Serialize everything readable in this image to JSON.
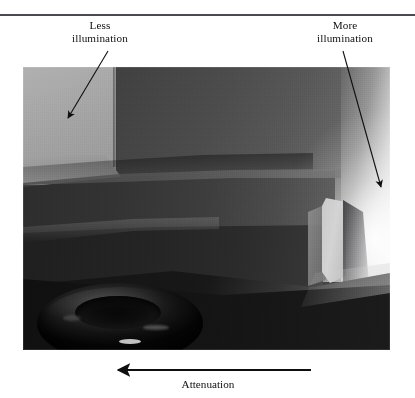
{
  "figure": {
    "kind": "annotated-rendered-image",
    "rule_color": "#4a4a52",
    "background": "#ffffff"
  },
  "annotations": {
    "less": {
      "line1": "Less",
      "line2": "illumination"
    },
    "more": {
      "line1": "More",
      "line2": "illumination"
    },
    "attenuation_label": "Attenuation"
  },
  "scene": {
    "description": "Rendered interior corner showing a bench ledge and a dark glossy torus on a floor, lit from the right",
    "colors": {
      "left_wall": "#a8a8a8",
      "back_wall_dark": "#3d3d3d",
      "highlight": "#f2f2f2",
      "endcap": "#cccccc",
      "floor_dark": "#141414",
      "torus": "#0a0a0a"
    }
  },
  "arrows": {
    "less_leader": {
      "from": [
        108,
        52
      ],
      "to": [
        68,
        119
      ],
      "head": "down-left"
    },
    "more_leader": {
      "from": [
        343,
        52
      ],
      "to": [
        381,
        188
      ],
      "head": "down-right"
    },
    "attenuation": {
      "from": [
        311,
        370
      ],
      "to": [
        117,
        370
      ],
      "head": "left"
    }
  }
}
